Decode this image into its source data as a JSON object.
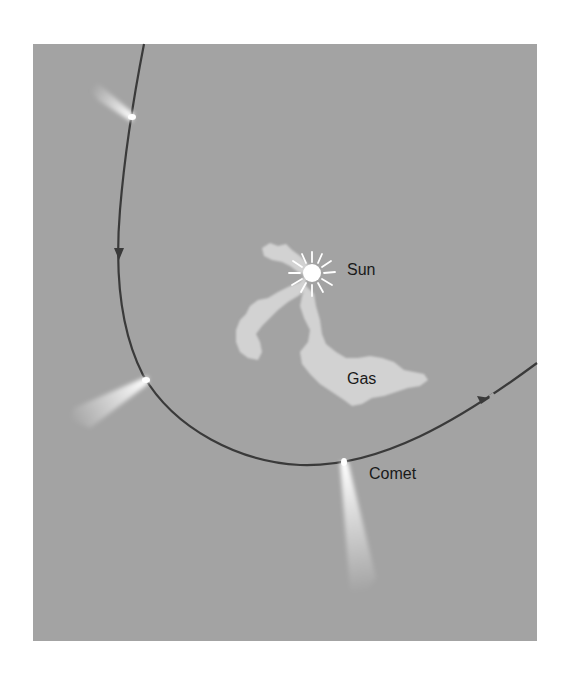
{
  "diagram": {
    "type": "comet-orbit-illustration",
    "colors": {
      "background": "#ffffff",
      "panel": "#a3a3a3",
      "orbit": "#3a3a3a",
      "gas": "#d2d2d2",
      "sun": "#ffffff",
      "comet": "#ffffff",
      "text": "#1a1a1a"
    },
    "labels": {
      "sun": "Sun",
      "gas": "Gas",
      "comet": "Comet"
    },
    "comets": [
      {
        "name": "comet-top",
        "head": [
          133,
          118
        ],
        "tail_direction": "away-from-sun"
      },
      {
        "name": "comet-left",
        "head": [
          147,
          380
        ],
        "tail_direction": "away-from-sun"
      },
      {
        "name": "comet-bottom",
        "head": [
          344,
          462
        ],
        "tail_direction": "away-from-sun"
      }
    ],
    "orbit_arrows": [
      {
        "position": [
          119,
          258
        ],
        "direction": "down"
      },
      {
        "position": [
          486,
          400
        ],
        "direction": "up-right"
      }
    ]
  }
}
